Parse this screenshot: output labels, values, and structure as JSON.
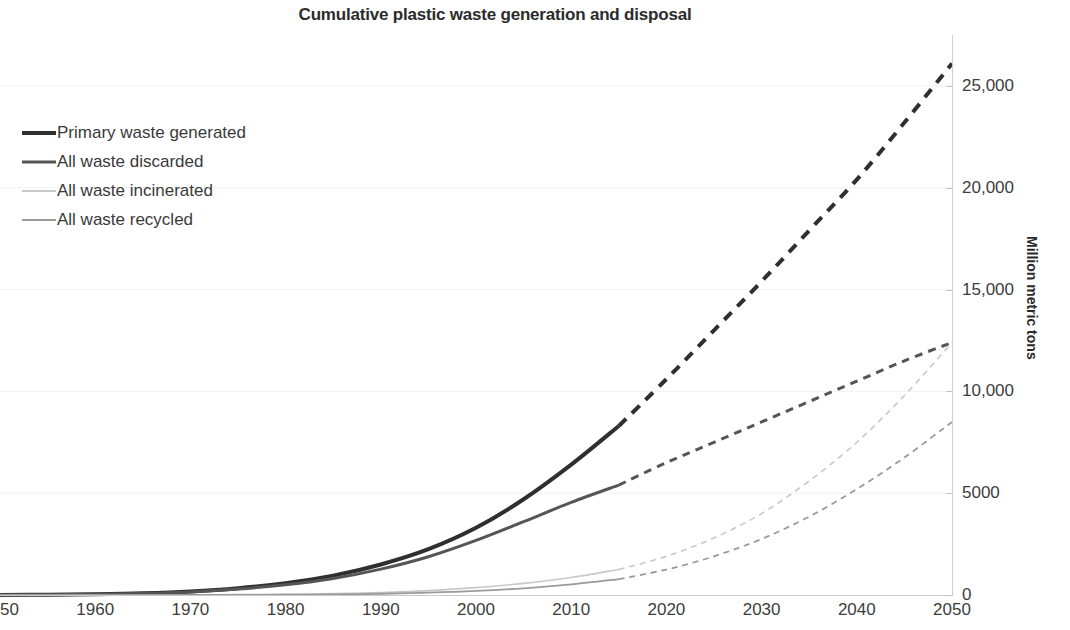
{
  "chart_data": {
    "type": "line",
    "title": "Cumulative plastic waste generation and disposal",
    "xlabel": "",
    "ylabel": "Million metric tons",
    "xlim": [
      1950,
      2050
    ],
    "ylim": [
      0,
      27500
    ],
    "grid": true,
    "legend_position": "upper-left",
    "x_ticks": [
      "1950",
      "1960",
      "1970",
      "1980",
      "1990",
      "2000",
      "2010",
      "2020",
      "2030",
      "2040",
      "2050"
    ],
    "y_ticks": [
      "0",
      "5000",
      "10,000",
      "15,000",
      "20,000",
      "25,000"
    ],
    "y_tick_values": [
      0,
      5000,
      10000,
      15000,
      20000,
      25000
    ],
    "historical_end_year": 2015,
    "note_projection": "Solid segment is historical data through 2015; dashed segment is projection to 2050.",
    "x": [
      1950,
      1955,
      1960,
      1965,
      1970,
      1975,
      1980,
      1985,
      1990,
      1995,
      2000,
      2005,
      2010,
      2015,
      2020,
      2025,
      2030,
      2035,
      2040,
      2045,
      2050
    ],
    "series": [
      {
        "name": "Primary waste generated",
        "color": "#2f2f2f",
        "width": 4,
        "values": [
          2,
          12,
          35,
          80,
          170,
          330,
          580,
          950,
          1500,
          2250,
          3300,
          4700,
          6400,
          8300,
          10600,
          13000,
          15400,
          17900,
          20400,
          23200,
          26100
        ]
      },
      {
        "name": "All waste discarded",
        "color": "#555555",
        "width": 3,
        "values": [
          2,
          11,
          32,
          72,
          150,
          290,
          500,
          810,
          1270,
          1880,
          2680,
          3600,
          4550,
          5400,
          6500,
          7500,
          8500,
          9500,
          10500,
          11500,
          12400
        ]
      },
      {
        "name": "All waste incinerated",
        "color": "#c8c8c8",
        "width": 1.6,
        "values": [
          0,
          0,
          1,
          3,
          8,
          18,
          38,
          70,
          125,
          215,
          360,
          570,
          860,
          1250,
          1900,
          2800,
          4000,
          5600,
          7500,
          9800,
          12400
        ]
      },
      {
        "name": "All waste recycled",
        "color": "#9a9a9a",
        "width": 1.8,
        "values": [
          0,
          0,
          0,
          1,
          3,
          7,
          16,
          32,
          62,
          115,
          200,
          330,
          520,
          780,
          1250,
          1900,
          2750,
          3850,
          5200,
          6750,
          8500
        ]
      }
    ]
  },
  "legend": {
    "items": [
      {
        "label": "Primary waste generated"
      },
      {
        "label": "All waste discarded"
      },
      {
        "label": "All waste incinerated"
      },
      {
        "label": "All waste recycled"
      }
    ]
  }
}
